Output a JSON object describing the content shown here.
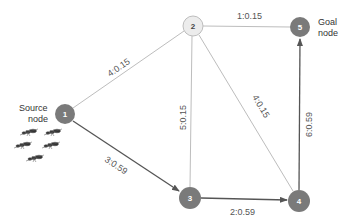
{
  "diagram": {
    "type": "graph",
    "colors": {
      "node_dark": "#7a7a7a",
      "node_light": "#ececec",
      "node_light_stroke": "#bdbdbd",
      "edge_light": "#bdbdbd",
      "edge_dark": "#555555",
      "edge_label": "#555555"
    },
    "nodes": [
      {
        "id": "1",
        "label": "1",
        "x": 65,
        "y": 114,
        "style": "dark"
      },
      {
        "id": "2",
        "label": "2",
        "x": 193,
        "y": 26,
        "style": "light"
      },
      {
        "id": "3",
        "label": "3",
        "x": 190,
        "y": 198,
        "style": "dark"
      },
      {
        "id": "4",
        "label": "4",
        "x": 299,
        "y": 201,
        "style": "dark"
      },
      {
        "id": "5",
        "label": "5",
        "x": 300,
        "y": 27,
        "style": "dark"
      }
    ],
    "edges": [
      {
        "from": "1",
        "to": "2",
        "label": "4:0.15",
        "style": "light",
        "directed": false
      },
      {
        "from": "2",
        "to": "5",
        "label": "1:0.15",
        "style": "light",
        "directed": false
      },
      {
        "from": "2",
        "to": "3",
        "label": "5:0.15",
        "style": "light",
        "directed": false
      },
      {
        "from": "2",
        "to": "4",
        "label": "4:0.15",
        "style": "light",
        "directed": false
      },
      {
        "from": "1",
        "to": "3",
        "label": "3:0.59",
        "style": "dark",
        "directed": true
      },
      {
        "from": "3",
        "to": "4",
        "label": "2:0.59",
        "style": "dark",
        "directed": true
      },
      {
        "from": "4",
        "to": "5",
        "label": "6:0.59",
        "style": "dark",
        "directed": true
      }
    ],
    "annotations": {
      "source_line1": "Source",
      "source_line2": "node",
      "goal_line1": "Goal",
      "goal_line2": "node"
    },
    "illustration": "ants-icon"
  }
}
